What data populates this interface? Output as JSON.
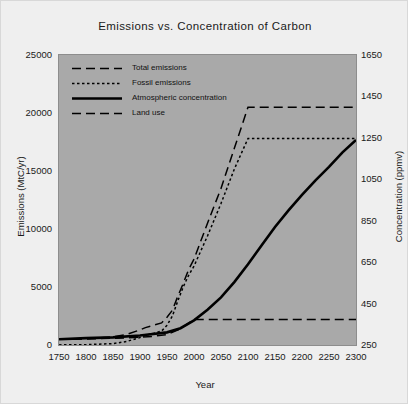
{
  "chart_data": {
    "type": "line",
    "title": "Emissions vs. Concentration of Carbon",
    "xlabel": "Year",
    "ylabel": "Emissions (MtC/yr)",
    "ylabel_right": "Concentration (ppmv)",
    "xlim": [
      1750,
      2300
    ],
    "ylim": [
      0,
      25000
    ],
    "ylim_right": [
      250,
      1650
    ],
    "xticks": [
      1750,
      1800,
      1850,
      1900,
      1950,
      2000,
      2050,
      2100,
      2150,
      2200,
      2250,
      2300
    ],
    "yticks_left": [
      0,
      5000,
      10000,
      15000,
      20000,
      25000
    ],
    "yticks_right": [
      250,
      450,
      650,
      850,
      1050,
      1250,
      1450,
      1650
    ],
    "grid": false,
    "legend_position": "upper left",
    "plot_bgcolor": "#a9a9a9",
    "figure_bgcolor": "#efefef",
    "line_color": "#000000",
    "series": [
      {
        "name": "Total emissions",
        "axis": "left",
        "style": "long-dash",
        "x": [
          1750,
          1800,
          1850,
          1875,
          1900,
          1910,
          1925,
          1940,
          1950,
          1960,
          1970,
          1980,
          1990,
          2000,
          2025,
          2050,
          2075,
          2100,
          2150,
          2200,
          2250,
          2300
        ],
        "values": [
          500,
          550,
          700,
          900,
          1300,
          1500,
          1700,
          1900,
          2400,
          3000,
          4200,
          5300,
          6500,
          7400,
          10500,
          13500,
          17000,
          20500,
          20500,
          20500,
          20500,
          20500
        ]
      },
      {
        "name": "Fossil emissions",
        "axis": "left",
        "style": "short-dash",
        "x": [
          1750,
          1800,
          1850,
          1875,
          1900,
          1910,
          1925,
          1940,
          1950,
          1960,
          1970,
          1980,
          1990,
          2000,
          2025,
          2050,
          2075,
          2100,
          2150,
          2200,
          2250,
          2300
        ],
        "values": [
          10,
          30,
          120,
          300,
          650,
          850,
          1000,
          1200,
          1700,
          2500,
          3800,
          5000,
          6000,
          6800,
          9400,
          12200,
          15200,
          17800,
          17800,
          17800,
          17800,
          17800
        ]
      },
      {
        "name": "Atmospheric concentration",
        "axis": "right",
        "style": "solid",
        "x": [
          1750,
          1800,
          1850,
          1900,
          1950,
          1975,
          2000,
          2025,
          2050,
          2075,
          2100,
          2125,
          2150,
          2175,
          2200,
          2225,
          2250,
          2275,
          2300
        ],
        "values": [
          278,
          283,
          287,
          296,
          311,
          331,
          369,
          420,
          480,
          555,
          640,
          730,
          820,
          900,
          975,
          1045,
          1110,
          1180,
          1240
        ]
      },
      {
        "name": "Land use",
        "axis": "left",
        "style": "long-dash",
        "x": [
          1750,
          1800,
          1850,
          1875,
          1900,
          1925,
          1950,
          1975,
          2000,
          2050,
          2100,
          2150,
          2200,
          2250,
          2300
        ],
        "values": [
          490,
          520,
          580,
          620,
          680,
          750,
          900,
          1400,
          2200,
          2200,
          2200,
          2200,
          2200,
          2200,
          2200
        ]
      }
    ]
  },
  "legend": {
    "items": [
      {
        "label": "Total emissions"
      },
      {
        "label": "Fossil emissions"
      },
      {
        "label": "Atmospheric concentration"
      },
      {
        "label": "Land use"
      }
    ]
  }
}
